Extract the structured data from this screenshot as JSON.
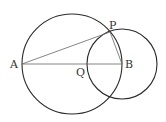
{
  "diagram": {
    "type": "geometry",
    "colors": {
      "stroke": "#2a2a2a",
      "thin_stroke": "#666666",
      "label": "#333333"
    },
    "points": [
      {
        "id": "A",
        "label": "A",
        "x": 22,
        "y": 64
      },
      {
        "id": "B",
        "label": "B",
        "x": 122,
        "y": 64
      },
      {
        "id": "P",
        "label": "P",
        "x": 110,
        "y": 32
      },
      {
        "id": "Q",
        "label": "Q",
        "x": 87,
        "y": 64
      }
    ],
    "circles": [
      {
        "id": "circle-AB",
        "description": "circle with diameter AB",
        "cx": 72,
        "cy": 64,
        "r": 50
      },
      {
        "id": "circle-B",
        "description": "circle centered at B through P and Q",
        "cx": 122,
        "cy": 64,
        "r": 35
      }
    ],
    "segments": [
      {
        "id": "AB",
        "from": "A",
        "to": "B"
      },
      {
        "id": "AP",
        "from": "A",
        "to": "P"
      },
      {
        "id": "PB",
        "from": "P",
        "to": "B"
      }
    ],
    "labels": {
      "A": "A",
      "B": "B",
      "P": "P",
      "Q": "Q"
    }
  }
}
